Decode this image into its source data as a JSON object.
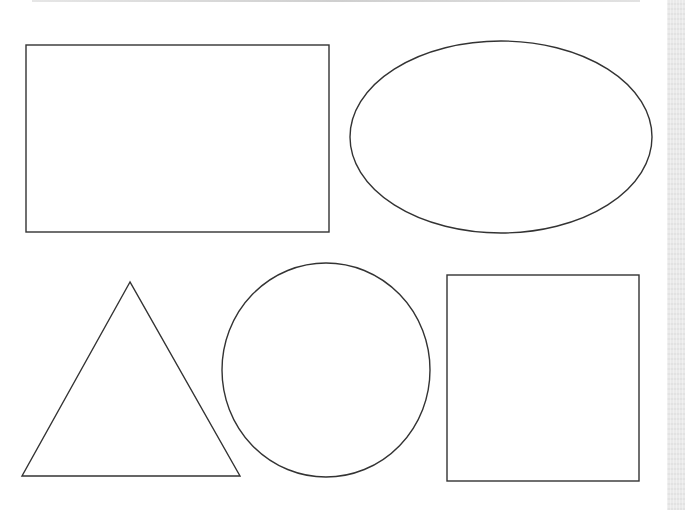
{
  "worksheet": {
    "stroke_color": "#333333",
    "background_color": "#ffffff",
    "side_strip_color": "#e9e9e9",
    "shapes": [
      {
        "type": "rectangle",
        "x": 26,
        "y": 45,
        "width": 303,
        "height": 187
      },
      {
        "type": "ellipse",
        "cx": 501,
        "cy": 137,
        "rx": 151,
        "ry": 96
      },
      {
        "type": "triangle",
        "points": "130,282 22,476 240,476"
      },
      {
        "type": "circle",
        "cx": 326,
        "cy": 370,
        "rx": 104,
        "ry": 107
      },
      {
        "type": "square",
        "x": 447,
        "y": 275,
        "width": 192,
        "height": 206
      }
    ]
  }
}
